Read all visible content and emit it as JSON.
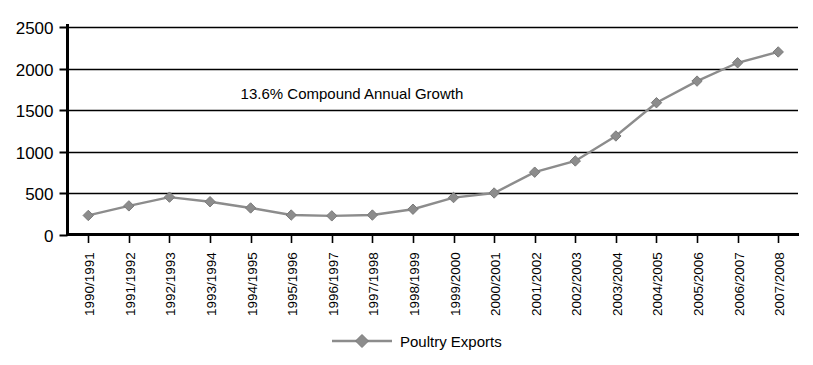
{
  "chart_data": {
    "type": "line",
    "title": "",
    "xlabel": "",
    "ylabel": "",
    "grid": "horizontal",
    "legend_position": "bottom",
    "ylim": [
      0,
      2500
    ],
    "yticks": [
      0,
      500,
      1000,
      1500,
      2000,
      2500
    ],
    "ytick_labels": [
      "0",
      "500",
      "1000",
      "1500",
      "2000",
      "2500"
    ],
    "categories": [
      "1990/1991",
      "1991/1992",
      "1992/1993",
      "1993/1994",
      "1994/1995",
      "1995/1996",
      "1996/1997",
      "1997/1998",
      "1998/1999",
      "1999/2000",
      "2000/2001",
      "2001/2002",
      "2002/2003",
      "2003/2004",
      "2004/2005",
      "2005/2006",
      "2006/2007",
      "2007/2008"
    ],
    "series": [
      {
        "name": "Poultry Exports",
        "color": "#8c8c8c",
        "marker": "diamond",
        "values": [
          235,
          350,
          455,
          400,
          325,
          240,
          230,
          240,
          310,
          450,
          505,
          755,
          890,
          1190,
          1590,
          1850,
          2070,
          2200
        ]
      }
    ],
    "annotations": [
      {
        "text": "13.6% Compound Annual Growth",
        "x_category": "1994/1995",
        "y_value": 1700
      }
    ]
  },
  "legend": {
    "entries": [
      {
        "label": "Poultry Exports",
        "color": "#8c8c8c"
      }
    ]
  },
  "colors": {
    "series": "#8c8c8c",
    "axis": "#000000",
    "grid": "#000000",
    "background": "#ffffff"
  }
}
